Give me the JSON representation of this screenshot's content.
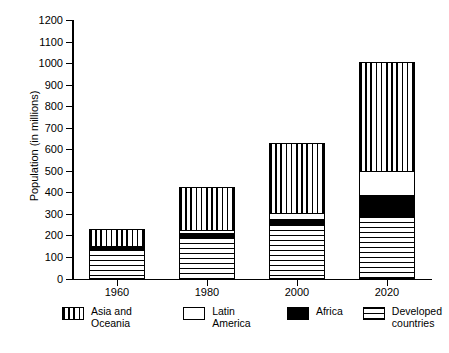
{
  "chart_data": {
    "type": "bar",
    "subtype": "stacked",
    "title": "",
    "xlabel": "",
    "ylabel": "Population (in millions)",
    "categories": [
      "1960",
      "1980",
      "2000",
      "2020"
    ],
    "ylim": [
      0,
      1200
    ],
    "ytick_step": 100,
    "yticks": [
      0,
      100,
      200,
      300,
      400,
      500,
      600,
      700,
      800,
      900,
      1000,
      1100,
      1200
    ],
    "grid": false,
    "legend_position": "bottom",
    "series": [
      {
        "name": "Developed countries",
        "pattern": "horizontal-lines",
        "values": [
          130,
          185,
          245,
          280
        ]
      },
      {
        "name": "Africa",
        "pattern": "solid-black",
        "values": [
          8,
          20,
          25,
          100
        ]
      },
      {
        "name": "Latin America",
        "pattern": "white",
        "values": [
          6,
          10,
          28,
          110
        ]
      },
      {
        "name": "Asia and Oceania",
        "pattern": "vertical-lines",
        "values": [
          81,
          205,
          322,
          510
        ]
      }
    ],
    "totals": [
      225,
      420,
      620,
      1000
    ],
    "stack_order_bottom_to_top": [
      "Developed countries",
      "Africa",
      "Latin America",
      "Asia and Oceania"
    ]
  },
  "legend": {
    "items": [
      {
        "label": "Asia and Oceania",
        "pattern": "vertical-lines"
      },
      {
        "label": "Latin America",
        "pattern": "white"
      },
      {
        "label": "Africa",
        "pattern": "solid-black"
      },
      {
        "label": "Developed\ncountries",
        "pattern": "horizontal-lines"
      }
    ]
  },
  "colors": {
    "ink": "#000000",
    "background": "#ffffff"
  }
}
